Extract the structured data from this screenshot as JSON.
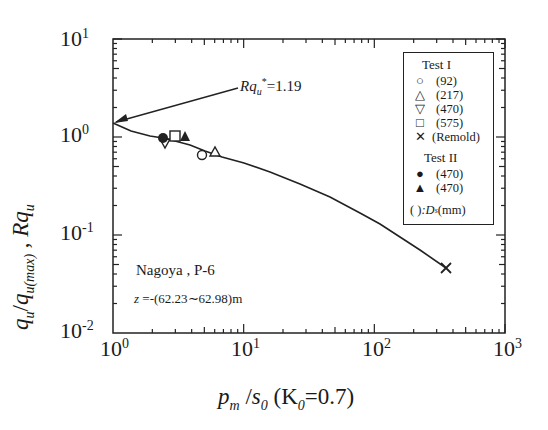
{
  "chart_data": {
    "type": "scatter",
    "title": "",
    "xlabel": "p_m / s_0 (K_0=0.7)",
    "ylabel": "q_u / q_u(max) , Rq_u",
    "xscale": "log",
    "yscale": "log",
    "xlim": [
      1,
      1000
    ],
    "ylim": [
      0.01,
      10
    ],
    "x_tick_labels": [
      "10^0",
      "10^1",
      "10^2",
      "10^3"
    ],
    "y_tick_labels": [
      "10^-2",
      "10^-1",
      "10^0",
      "10^1"
    ],
    "grid": false,
    "legend_position": "upper right (inside)",
    "series": [
      {
        "name": "Test I (92)",
        "marker": "open-circle",
        "points": [
          [
            4.8,
            0.65
          ]
        ]
      },
      {
        "name": "Test I (217)",
        "marker": "open-triangle-up",
        "points": [
          [
            6.0,
            0.7
          ]
        ]
      },
      {
        "name": "Test I (470)",
        "marker": "open-triangle-down",
        "points": [
          [
            2.5,
            0.89
          ]
        ]
      },
      {
        "name": "Test I (575)",
        "marker": "open-square",
        "points": [
          [
            3.0,
            1.02
          ]
        ]
      },
      {
        "name": "Test I (Remold)",
        "marker": "x",
        "points": [
          [
            350,
            0.046
          ]
        ]
      },
      {
        "name": "Test II (470)",
        "marker": "filled-circle",
        "points": [
          [
            2.4,
            0.97
          ]
        ]
      },
      {
        "name": "Test II (470)",
        "marker": "filled-triangle-up",
        "points": [
          [
            3.5,
            1.02
          ]
        ]
      },
      {
        "name": "Fitted curve",
        "marker": "line",
        "points": [
          [
            1,
            1.19
          ],
          [
            2,
            1.0
          ],
          [
            3,
            0.93
          ],
          [
            5,
            0.75
          ],
          [
            10,
            0.55
          ],
          [
            30,
            0.33
          ],
          [
            100,
            0.16
          ],
          [
            200,
            0.085
          ],
          [
            350,
            0.046
          ]
        ]
      }
    ],
    "annotations": [
      {
        "text": "Rq_u* = 1.19",
        "points_to": [
          1,
          1.19
        ]
      },
      {
        "text": "Nagoya , P-6"
      },
      {
        "text": "z = -(62.23~62.98)m"
      }
    ]
  },
  "axes": {
    "y_ticks": [
      {
        "base": "10",
        "exp": "1"
      },
      {
        "base": "10",
        "exp": "0"
      },
      {
        "base": "10",
        "exp": "-1"
      },
      {
        "base": "10",
        "exp": "-2"
      }
    ],
    "x_ticks": [
      {
        "base": "10",
        "exp": "0"
      },
      {
        "base": "10",
        "exp": "1"
      },
      {
        "base": "10",
        "exp": "2"
      },
      {
        "base": "10",
        "exp": "3"
      }
    ],
    "ylabel_main": "q",
    "ylabel_sub1": "u",
    "ylabel_slash": "/",
    "ylabel_q2": "q",
    "ylabel_sub2": "u(max)",
    "ylabel_sep": " , ",
    "ylabel_R": "Rq",
    "ylabel_R_sub": "u",
    "xlabel_p": "p",
    "xlabel_p_sub": "m",
    "xlabel_slash": " /",
    "xlabel_s": "s",
    "xlabel_s_sub": "0",
    "xlabel_k_open": " (K",
    "xlabel_k_sub": "0",
    "xlabel_k_rest": "=0.7)"
  },
  "annotation": {
    "rq_main": "Rq",
    "rq_sub": "u",
    "rq_sup": "*",
    "rq_value": "=1.19",
    "site": "Nagoya , P-6",
    "depth_z": "z",
    "depth_value": " =-(62.23∼62.98)m"
  },
  "legend": {
    "test1_header": "Test I",
    "test2_header": "Test II",
    "items": [
      {
        "symbol": "○",
        "label": "(92)"
      },
      {
        "symbol": "△",
        "label": "(217)"
      },
      {
        "symbol": "▽",
        "label": "(470)"
      },
      {
        "symbol": "□",
        "label": "(575)"
      },
      {
        "symbol": "✕",
        "label": "(Remold)"
      },
      {
        "symbol": "●",
        "label": "(470)"
      },
      {
        "symbol": "▲",
        "label": "(470)"
      }
    ],
    "footnote_paren": "(     )",
    "footnote_D": ":D",
    "footnote_sub": "s",
    "footnote_unit": "(mm)"
  }
}
